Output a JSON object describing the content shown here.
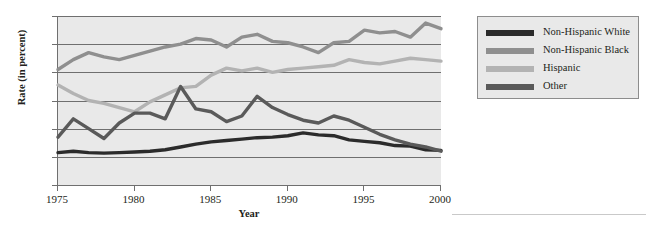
{
  "figure": {
    "top_caption": "",
    "ylabel": "Rate (in percent)",
    "xlabel": "Year"
  },
  "legend": {
    "items": [
      {
        "label": "Non-Hispanic White",
        "color": "#2b2b2b"
      },
      {
        "label": "Non-Hispanic Black",
        "color": "#8f8f8f"
      },
      {
        "label": "Hispanic",
        "color": "#b3b3b3"
      },
      {
        "label": "Other",
        "color": "#5a5a5a"
      }
    ]
  },
  "chart_data": {
    "type": "line",
    "title": "",
    "xlabel": "Year",
    "ylabel": "Rate (in percent)",
    "xlim": [
      1975,
      2000
    ],
    "ylim": [
      0,
      60
    ],
    "xticks": [
      1975,
      1980,
      1985,
      1990,
      1995,
      2000
    ],
    "yticks": [
      0,
      10,
      20,
      30,
      40,
      50,
      60
    ],
    "grid": "horizontal",
    "legend_position": "right",
    "plot_background": "#e9e9e9",
    "x": [
      1975,
      1976,
      1977,
      1978,
      1979,
      1980,
      1981,
      1982,
      1983,
      1984,
      1985,
      1986,
      1987,
      1988,
      1989,
      1990,
      1991,
      1992,
      1993,
      1994,
      1995,
      1996,
      1997,
      1998,
      1999,
      2000
    ],
    "series": [
      {
        "name": "Non-Hispanic White",
        "color": "#2b2b2b",
        "values": [
          11.5,
          12.0,
          11.5,
          11.3,
          11.5,
          11.7,
          12.0,
          12.5,
          13.5,
          14.5,
          15.3,
          15.8,
          16.3,
          16.8,
          17.0,
          17.5,
          18.5,
          17.8,
          17.5,
          16.0,
          15.5,
          15.0,
          14.0,
          13.8,
          12.5,
          12.3
        ]
      },
      {
        "name": "Non-Hispanic Black",
        "color": "#8f8f8f",
        "values": [
          41.0,
          44.5,
          47.0,
          45.5,
          44.5,
          46.0,
          47.5,
          49.0,
          50.0,
          52.0,
          51.5,
          49.0,
          52.5,
          53.5,
          51.0,
          50.5,
          49.0,
          47.0,
          50.5,
          51.0,
          55.0,
          54.0,
          54.5,
          52.5,
          57.5,
          55.5
        ]
      },
      {
        "name": "Hispanic",
        "color": "#b3b3b3",
        "values": [
          35.5,
          32.5,
          30.0,
          29.0,
          27.5,
          26.0,
          29.5,
          32.0,
          34.5,
          35.0,
          39.0,
          41.5,
          40.5,
          41.5,
          40.0,
          41.0,
          41.5,
          42.0,
          42.5,
          44.5,
          43.5,
          43.0,
          44.0,
          45.0,
          44.5,
          44.0
        ]
      },
      {
        "name": "Other",
        "color": "#5a5a5a",
        "values": [
          17.0,
          23.5,
          20.0,
          16.5,
          22.0,
          25.5,
          25.5,
          23.5,
          35.0,
          27.0,
          26.0,
          22.5,
          24.5,
          31.5,
          27.5,
          25.0,
          23.0,
          22.0,
          24.5,
          23.0,
          20.5,
          18.0,
          16.0,
          14.5,
          13.5,
          12.0
        ]
      }
    ]
  }
}
